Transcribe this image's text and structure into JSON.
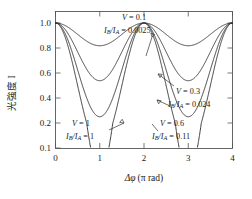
{
  "chart_data": {
    "type": "line",
    "title": "",
    "xlabel": "Δφ (π rad)",
    "ylabel": "光強度 I",
    "xlim": [
      0,
      4
    ],
    "ylim": [
      0.1,
      1.0
    ],
    "xticks": [
      "0",
      "1",
      "2",
      "3",
      "4"
    ],
    "yticks": [
      "1.0",
      "0.8",
      "0.6",
      "0.4",
      "0.2",
      "0.1"
    ],
    "ytick_values": [
      1.0,
      0.8,
      0.6,
      0.4,
      0.2,
      0.1
    ],
    "grid": false,
    "legend_position": "inline-annotations",
    "yaxis_scale": "nonlinear-compressed",
    "formula": "I = (1 + V cos(Δφ·π)) / (1 + V)",
    "series": [
      {
        "name": "V = 0.1",
        "visibility": 0.1,
        "ratio": 0.0025,
        "minimum": 0.818,
        "maximum": 1.0,
        "minima_at": [
          0,
          2,
          4
        ],
        "maxima_at": [
          1,
          3
        ]
      },
      {
        "name": "V = 0.3",
        "visibility": 0.3,
        "ratio": 0.024,
        "minimum": 0.538,
        "maximum": 1.0,
        "minima_at": [
          0,
          2,
          4
        ],
        "maxima_at": [
          1,
          3
        ]
      },
      {
        "name": "V = 0.6",
        "visibility": 0.6,
        "ratio": 0.11,
        "minimum": 0.25,
        "maximum": 1.0,
        "minima_at": [
          0,
          2,
          4
        ],
        "maxima_at": [
          1,
          3
        ]
      },
      {
        "name": "V = 1",
        "visibility": 1.0,
        "ratio": 1.0,
        "minimum": 0.0,
        "maximum": 1.0,
        "minima_at": [
          0,
          2,
          4
        ],
        "maxima_at": [
          1,
          3
        ]
      }
    ],
    "annotations": [
      {
        "id": "annot-v01",
        "line1": "V = 0.1",
        "line2_pre": "I",
        "line2_sub1": "B",
        "line2_mid": "/I",
        "line2_sub2": "A",
        "line2_post": " = 0.0025"
      },
      {
        "id": "annot-v03",
        "line1": "V = 0.3",
        "line2_pre": "I",
        "line2_sub1": "B",
        "line2_mid": "/I",
        "line2_sub2": "A",
        "line2_post": " = 0.024"
      },
      {
        "id": "annot-v06",
        "line1": "V = 0.6",
        "line2_pre": "I",
        "line2_sub1": "B",
        "line2_mid": "/I",
        "line2_sub2": "A",
        "line2_post": " = 0.11"
      },
      {
        "id": "annot-v1",
        "line1": "V = 1",
        "line2_pre": "I",
        "line2_sub1": "B",
        "line2_mid": "/I",
        "line2_sub2": "A",
        "line2_post": " = 1"
      }
    ]
  },
  "axes": {
    "x": {
      "label_delta": "Δφ",
      "label_unit": "(π rad)",
      "ticks": [
        "0",
        "1",
        "2",
        "3",
        "4"
      ]
    },
    "y": {
      "label": "光強度 I",
      "ticks": [
        "1.0",
        "0.8",
        "0.6",
        "0.4",
        "0.2",
        "0.1"
      ]
    }
  }
}
